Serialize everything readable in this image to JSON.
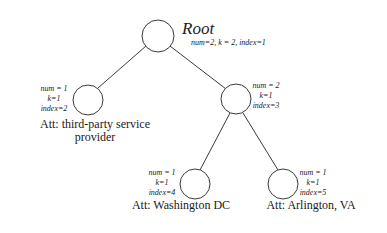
{
  "diagram": {
    "type": "tree",
    "edge_color": "#3a3a3a",
    "node_stroke": "#3a3a3a",
    "nodes": [
      {
        "id": "root",
        "title": "Root",
        "meta_inline": "num=2, k = 2, index=1",
        "num": 2,
        "k": 2,
        "index": 1
      },
      {
        "id": "node2",
        "meta": [
          "num = 1",
          "k=1",
          "index=2"
        ],
        "num": 1,
        "k": 1,
        "index": 2,
        "attribute": "Att: third-party service provider",
        "attribute_lines": [
          "Att: third-party service",
          "provider"
        ]
      },
      {
        "id": "node3",
        "meta": [
          "num = 2",
          "k=1",
          "index=3"
        ],
        "num": 2,
        "k": 1,
        "index": 3
      },
      {
        "id": "node4",
        "meta": [
          "num = 1",
          "k=1",
          "index=4"
        ],
        "num": 1,
        "k": 1,
        "index": 4,
        "attribute": "Att: Washington DC"
      },
      {
        "id": "node5",
        "meta": [
          "num = 1",
          "k=1",
          "index=5"
        ],
        "num": 1,
        "k": 1,
        "index": 5,
        "attribute": "Att: Arlington, VA"
      }
    ],
    "edges": [
      [
        "root",
        "node2"
      ],
      [
        "root",
        "node3"
      ],
      [
        "node3",
        "node4"
      ],
      [
        "node3",
        "node5"
      ]
    ]
  }
}
